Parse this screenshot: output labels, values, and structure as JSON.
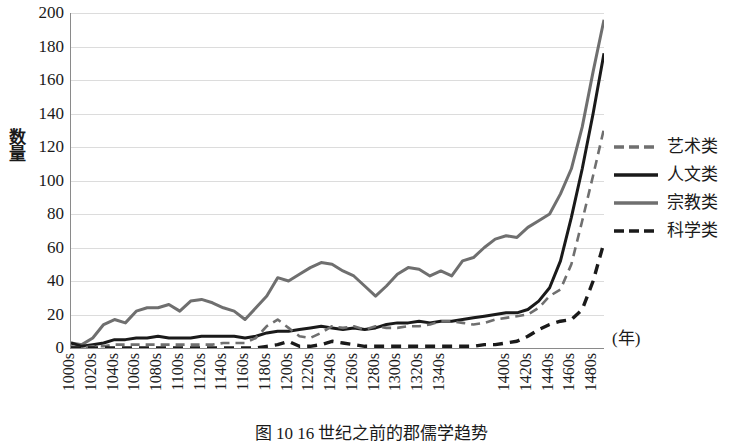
{
  "axes": {
    "y_label": "数量",
    "y_ticks": [
      200,
      180,
      160,
      140,
      120,
      100,
      80,
      60,
      40,
      20,
      0
    ],
    "x_note": "(年)",
    "x_tick_labels": [
      "1000s",
      "1020s",
      "1040s",
      "1060s",
      "1080s",
      "1100s",
      "1120s",
      "1140s",
      "1160s",
      "1180s",
      "1200s",
      "1220s",
      "1240s",
      "1260s",
      "1280s",
      "1300s",
      "1320s",
      "1340s",
      "1400s",
      "1420s",
      "1440s",
      "1460s",
      "1480s"
    ]
  },
  "legend": {
    "position": "right",
    "items": [
      {
        "label": "艺术类",
        "style": "dashed",
        "color": "#6f6f6f",
        "width": 2.6,
        "dash": "9,6"
      },
      {
        "label": "人文类",
        "style": "solid",
        "color": "#1a1a1a",
        "width": 3.0,
        "dash": "none"
      },
      {
        "label": "宗教类",
        "style": "solid",
        "color": "#6f6f6f",
        "width": 3.0,
        "dash": "none"
      },
      {
        "label": "科学类",
        "style": "dashed",
        "color": "#1a1a1a",
        "width": 3.4,
        "dash": "10,7"
      }
    ]
  },
  "caption": "图 10  16 世纪之前的郡儒学趋势",
  "chart_data": {
    "type": "line",
    "title": "",
    "xlabel": "(年)",
    "ylabel": "数量",
    "ylim": [
      0,
      200
    ],
    "ytick_step": 20,
    "grid": true,
    "x": [
      "1000s",
      "1010s",
      "1020s",
      "1030s",
      "1040s",
      "1050s",
      "1060s",
      "1070s",
      "1080s",
      "1090s",
      "1100s",
      "1110s",
      "1120s",
      "1130s",
      "1140s",
      "1150s",
      "1160s",
      "1170s",
      "1180s",
      "1190s",
      "1200s",
      "1210s",
      "1220s",
      "1230s",
      "1240s",
      "1250s",
      "1260s",
      "1270s",
      "1280s",
      "1290s",
      "1300s",
      "1310s",
      "1320s",
      "1330s",
      "1340s",
      "1350s",
      "1360s",
      "1370s",
      "1380s",
      "1390s",
      "1400s",
      "1410s",
      "1420s",
      "1430s",
      "1440s",
      "1450s",
      "1460s",
      "1470s",
      "1480s",
      "1490s"
    ],
    "series": [
      {
        "name": "宗教类",
        "color": "#6f6f6f",
        "style": "solid",
        "values": [
          3,
          2,
          6,
          14,
          17,
          15,
          22,
          24,
          24,
          26,
          22,
          28,
          29,
          27,
          24,
          22,
          17,
          24,
          31,
          42,
          40,
          44,
          48,
          51,
          50,
          46,
          43,
          37,
          31,
          37,
          44,
          48,
          47,
          43,
          46,
          43,
          52,
          54,
          60,
          65,
          67,
          66,
          72,
          76,
          80,
          92,
          107,
          132,
          165,
          196
        ]
      },
      {
        "name": "人文类",
        "color": "#1a1a1a",
        "style": "solid",
        "values": [
          3,
          1,
          2,
          3,
          5,
          5,
          6,
          6,
          7,
          6,
          6,
          6,
          7,
          7,
          7,
          7,
          6,
          7,
          9,
          10,
          10,
          11,
          12,
          13,
          12,
          11,
          12,
          11,
          12,
          14,
          15,
          15,
          16,
          15,
          16,
          16,
          17,
          18,
          19,
          20,
          21,
          21,
          23,
          28,
          36,
          52,
          78,
          107,
          140,
          176
        ]
      },
      {
        "name": "艺术类",
        "color": "#6f6f6f",
        "style": "dashed",
        "values": [
          1,
          0,
          1,
          1,
          2,
          2,
          2,
          2,
          2,
          2,
          2,
          2,
          2,
          2,
          3,
          3,
          3,
          6,
          13,
          17,
          12,
          7,
          6,
          9,
          13,
          12,
          13,
          11,
          13,
          12,
          12,
          13,
          13,
          14,
          16,
          16,
          15,
          14,
          15,
          17,
          18,
          19,
          20,
          24,
          31,
          35,
          50,
          76,
          103,
          131
        ]
      },
      {
        "name": "科学类",
        "color": "#1a1a1a",
        "style": "dashed",
        "values": [
          0,
          0,
          0,
          0,
          0,
          0,
          0,
          0,
          0,
          0,
          0,
          0,
          0,
          0,
          0,
          0,
          0,
          0,
          1,
          2,
          4,
          1,
          1,
          2,
          4,
          3,
          2,
          1,
          1,
          1,
          1,
          1,
          1,
          1,
          1,
          1,
          1,
          1,
          2,
          2,
          3,
          4,
          7,
          11,
          14,
          16,
          17,
          23,
          40,
          63
        ]
      }
    ]
  }
}
